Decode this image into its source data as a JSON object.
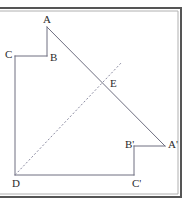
{
  "figure": {
    "frame": {
      "stroke": "#555555",
      "top_y": 8,
      "right_x": 181,
      "bottom_y": 197,
      "inner_stroke": "#9a9a9a"
    },
    "style": {
      "line_color": "#6e6e80",
      "dash_color": "#8a8aa0",
      "line_width": 1,
      "dash_pattern": "2,2"
    },
    "points": [
      {
        "id": "A",
        "label": "A",
        "x": 47,
        "y": 27,
        "label_x": 43,
        "label_y": 14
      },
      {
        "id": "B",
        "label": "B",
        "x": 47,
        "y": 56,
        "label_x": 50,
        "label_y": 52
      },
      {
        "id": "C",
        "label": "C",
        "x": 15,
        "y": 56,
        "label_x": 5,
        "label_y": 49
      },
      {
        "id": "D",
        "label": "D",
        "x": 15,
        "y": 175,
        "label_x": 12,
        "label_y": 178
      },
      {
        "id": "E",
        "label": "E",
        "x": 106,
        "y": 84,
        "label_x": 110,
        "label_y": 78
      },
      {
        "id": "Ap",
        "label": "A'",
        "x": 165,
        "y": 146,
        "label_x": 168,
        "label_y": 139
      },
      {
        "id": "Bp",
        "label": "B'",
        "x": 134,
        "y": 146,
        "label_x": 125,
        "label_y": 139
      },
      {
        "id": "Cp",
        "label": "C'",
        "x": 134,
        "y": 175,
        "label_x": 132,
        "label_y": 178
      }
    ],
    "segments": [
      {
        "name": "segment-A-B",
        "from": "A",
        "to": "B",
        "style": "solid"
      },
      {
        "name": "segment-B-C",
        "from": "B",
        "to": "C",
        "style": "solid"
      },
      {
        "name": "segment-C-D",
        "from": "C",
        "to": "D",
        "style": "solid"
      },
      {
        "name": "segment-D-Cprime",
        "from": "D",
        "to": "Cp",
        "style": "solid"
      },
      {
        "name": "segment-Cprime-Bprime",
        "from": "Cp",
        "to": "Bp",
        "style": "solid"
      },
      {
        "name": "segment-Bprime-Aprime",
        "from": "Bp",
        "to": "Ap",
        "style": "solid"
      },
      {
        "name": "segment-A-Aprime",
        "from": "A",
        "to": "Ap",
        "style": "solid"
      }
    ],
    "dashed_line": {
      "name": "dashed-line-D-through-E",
      "x1": 15,
      "y1": 175,
      "x2": 122,
      "y2": 62
    }
  }
}
